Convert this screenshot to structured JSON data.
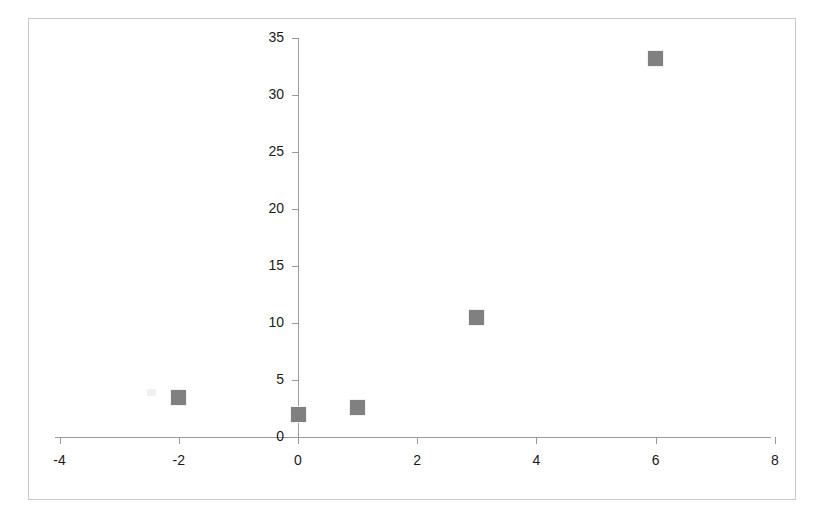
{
  "chart_data": {
    "type": "scatter",
    "title": "",
    "subtitle": "",
    "xlabel": "",
    "ylabel": "",
    "xlim": [
      -4,
      8
    ],
    "ylim": [
      0,
      35
    ],
    "grid": false,
    "legend": null,
    "legend_position": "none",
    "x_ticks": [
      "-4",
      "-2",
      "0",
      "2",
      "4",
      "6",
      "8"
    ],
    "x_tick_values": [
      -4,
      -2,
      0,
      2,
      4,
      6,
      8
    ],
    "y_ticks": [
      "0",
      "5",
      "10",
      "15",
      "20",
      "25",
      "30",
      "35"
    ],
    "y_tick_values": [
      0,
      5,
      10,
      15,
      20,
      25,
      30,
      35
    ],
    "series": [
      {
        "name": "",
        "marker": "square",
        "color": "#808080",
        "points": [
          {
            "x": -2,
            "y": 3.5
          },
          {
            "x": 0,
            "y": 2.0
          },
          {
            "x": 1,
            "y": 2.6
          },
          {
            "x": 3,
            "y": 10.5
          },
          {
            "x": 6,
            "y": 33.2
          }
        ]
      }
    ]
  },
  "figure": {
    "background_color": "#ffffff",
    "frame_color": "#c8c8c8",
    "axis_color": "#9a9a9a",
    "marker_color": "#808080",
    "tick_label_color": "#1a1a1a"
  }
}
